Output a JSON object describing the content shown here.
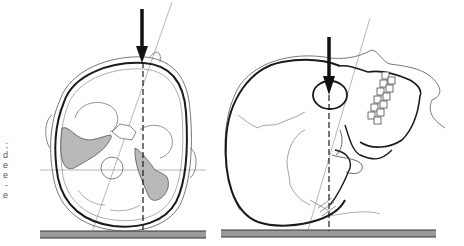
{
  "figure": {
    "panels": [
      {
        "id": "left",
        "label": "Superior view of skull with cranial base, arrow pressing down at vertex",
        "arrow": {
          "x": 142,
          "y_top": 9,
          "y_tip": 62
        }
      },
      {
        "id": "right",
        "label": "Lateral view of skull with face turned, arrow pressing down at orbit",
        "arrow": {
          "x": 329,
          "y_top": 37,
          "y_tip": 95
        }
      }
    ],
    "colors": {
      "line": "#1a1a1a",
      "thin_line": "#777777",
      "shading": "#b9b9b9",
      "floor": "#9a9a9a",
      "background": "#ffffff"
    }
  },
  "caption_fragment": [
    ";",
    "d",
    "e",
    "e",
    "-",
    "e"
  ]
}
